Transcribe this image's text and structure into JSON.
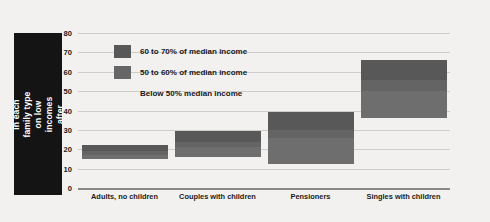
{
  "chart_data": {
    "type": "bar",
    "title": "",
    "subtitle": "",
    "xlabel": "",
    "ylabel": "Proportion of individuals in each family type on low incomes after housing costs (per cent)",
    "ylim": [
      0,
      80
    ],
    "yticks": [
      0,
      10,
      20,
      30,
      40,
      50,
      60,
      70,
      80
    ],
    "grid": true,
    "legend_position": "inside-top-left",
    "orientation": "vertical",
    "stacked": true,
    "note": "Floating stacked range bars: each bar spans from the 'Below 50% median income' level up to the '60 to 70% of median income' level.",
    "categories": [
      "Adults, no children",
      "Couples with children",
      "Pensioners",
      "Singles with children"
    ],
    "legend": [
      "60 to 70% of median income",
      "50 to 60% of median income",
      "Below 50% median income"
    ],
    "series": [
      {
        "name": "60 to 70% of median income",
        "values": [
          22,
          29.5,
          39,
          66
        ]
      },
      {
        "name": "50 to 60% of median income",
        "values": [
          19,
          24,
          30,
          56
        ]
      },
      {
        "name": "Below 50% median income",
        "values": [
          15,
          16,
          12.5,
          36
        ]
      }
    ],
    "bars": [
      {
        "category": "Adults, no children",
        "bottom": 15,
        "top": 22,
        "breaks": [
          19,
          17
        ]
      },
      {
        "category": "Couples with children",
        "bottom": 16,
        "top": 29.5,
        "breaks": [
          24,
          21
        ]
      },
      {
        "category": "Pensioners",
        "bottom": 12.5,
        "top": 39,
        "breaks": [
          30,
          26
        ]
      },
      {
        "category": "Singles with children",
        "bottom": 36,
        "top": 66,
        "breaks": [
          56,
          50
        ]
      }
    ],
    "colors": {
      "band_60_70": "#585858",
      "band_50_60": "#646464",
      "band_below_50": "#6e6e6e",
      "gridline": "#cfcdc9",
      "axis": "#8a8884",
      "label_box": "#141414",
      "label_text": "#ffffff",
      "background": "#f2f1ef"
    }
  }
}
